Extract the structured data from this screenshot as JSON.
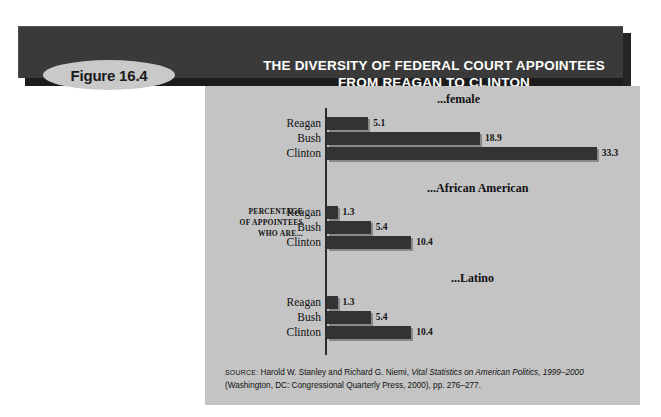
{
  "figure": {
    "badge_label": "Figure 16.4",
    "title_line1": "THE DIVERSITY OF FEDERAL COURT APPOINTEES",
    "title_line2": "FROM REAGAN TO CLINTON"
  },
  "axis": {
    "label_line1": "PERCENTAGE",
    "label_line2": "OF APPOINTEES",
    "label_line3": "WHO ARE..."
  },
  "source": {
    "prefix": "SOURCE:",
    "text_before_italic": " Harold W. Stanley and Richard G. Niemi,",
    "italic_title": " Vital Statistics on American Politics, 1999–2000",
    "line2": "(Washington, DC: Congressional Quarterly Press, 2000), pp. 276–277."
  },
  "chart_data": {
    "type": "bar",
    "orientation": "horizontal",
    "title": "THE DIVERSITY OF FEDERAL COURT APPOINTEES FROM REAGAN TO CLINTON",
    "xlabel": "",
    "ylabel": "PERCENTAGE OF APPOINTEES WHO ARE...",
    "xlim": [
      0,
      35
    ],
    "grid": false,
    "legend": "none",
    "categories": [
      "Reagan",
      "Bush",
      "Clinton"
    ],
    "panels": [
      {
        "title": "...female",
        "values": [
          5.1,
          18.9,
          33.3
        ],
        "labels": [
          "5.1",
          "18.9",
          "33.3"
        ]
      },
      {
        "title": "...African American",
        "values": [
          1.3,
          5.4,
          10.4
        ],
        "labels": [
          "1.3",
          "5.4",
          "10.4"
        ]
      },
      {
        "title": "...Latino",
        "values": [
          1.3,
          5.4,
          10.4
        ],
        "labels": [
          "1.3",
          "5.4",
          "10.4"
        ]
      }
    ],
    "colors": {
      "bar": "#333333",
      "panel_background": "#c4c4c4",
      "header_bar": "#3a3a3a",
      "badge": "#c9c9c9",
      "text": "#111111"
    }
  }
}
